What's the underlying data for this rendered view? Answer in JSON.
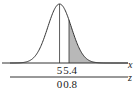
{
  "chart_data": {
    "type": "area",
    "title": "",
    "distribution": "normal",
    "mean": 5,
    "std": 0.5,
    "shaded_region": {
      "from": 5.4,
      "to": "inf",
      "color": "#b8b8b8"
    },
    "axes": [
      {
        "name": "x",
        "label": "x",
        "ticks": [
          5,
          5.4
        ],
        "tick_labels": [
          "5",
          "5.4"
        ]
      },
      {
        "name": "z",
        "label": "z",
        "ticks": [
          0,
          0.8
        ],
        "tick_labels": [
          "0",
          "0.8"
        ]
      }
    ],
    "xlim": [
      2.9,
      7.9
    ],
    "grid": false,
    "legend": "none",
    "curve_color": "#333333",
    "axis_color": "#333333"
  }
}
